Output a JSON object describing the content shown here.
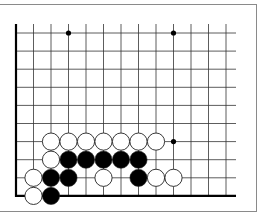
{
  "diagram": {
    "type": "go-board-fragment",
    "visible_columns": 13,
    "visible_rows": 10,
    "edges": [
      "left",
      "bottom"
    ],
    "grid": {
      "x0": 16,
      "dx": 17.5,
      "y0": 33,
      "dy": 18.1,
      "top_extent": 24,
      "right_extent": 236
    },
    "colors": {
      "line": "#333333",
      "edge": "#000000",
      "black_stone": "#000000",
      "white_stone": "#ffffff",
      "stone_outline": "#222222",
      "frame": "#8a8a8a"
    },
    "star_points": [
      {
        "col": 3,
        "row": 0
      },
      {
        "col": 9,
        "row": 0
      },
      {
        "col": 9,
        "row": 6
      }
    ],
    "stones": [
      {
        "color": "white",
        "col": 2,
        "row": 6
      },
      {
        "color": "white",
        "col": 3,
        "row": 6
      },
      {
        "color": "white",
        "col": 4,
        "row": 6
      },
      {
        "color": "white",
        "col": 5,
        "row": 6
      },
      {
        "color": "white",
        "col": 6,
        "row": 6
      },
      {
        "color": "white",
        "col": 7,
        "row": 6
      },
      {
        "color": "white",
        "col": 8,
        "row": 6
      },
      {
        "color": "white",
        "col": 2,
        "row": 7
      },
      {
        "color": "black",
        "col": 3,
        "row": 7
      },
      {
        "color": "black",
        "col": 4,
        "row": 7
      },
      {
        "color": "black",
        "col": 5,
        "row": 7
      },
      {
        "color": "black",
        "col": 6,
        "row": 7
      },
      {
        "color": "black",
        "col": 7,
        "row": 7
      },
      {
        "color": "white",
        "col": 1,
        "row": 8
      },
      {
        "color": "black",
        "col": 2,
        "row": 8
      },
      {
        "color": "black",
        "col": 3,
        "row": 8
      },
      {
        "color": "white",
        "col": 5,
        "row": 8
      },
      {
        "color": "black",
        "col": 7,
        "row": 8
      },
      {
        "color": "white",
        "col": 8,
        "row": 8
      },
      {
        "color": "white",
        "col": 9,
        "row": 8
      },
      {
        "color": "white",
        "col": 1,
        "row": 9
      },
      {
        "color": "black",
        "col": 2,
        "row": 9
      }
    ]
  }
}
